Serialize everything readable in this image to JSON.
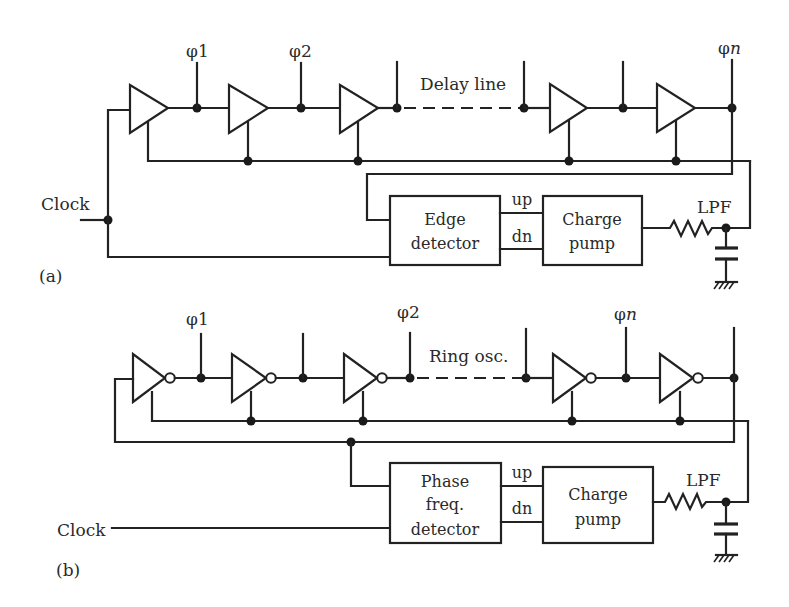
{
  "figure": {
    "panels": [
      {
        "id": "a",
        "panel_label": "(a)",
        "title": "Delay line",
        "clock_label": "Clock",
        "phase_labels": [
          "φ1",
          "φ2",
          "φn"
        ],
        "phase_symbol": "φ",
        "phase_n_suffix": "n",
        "stage_type": "buffer",
        "detector": {
          "lines": [
            "Edge",
            "detector"
          ]
        },
        "charge_pump": {
          "lines": [
            "Charge",
            "pump"
          ]
        },
        "signals": {
          "up": "up",
          "dn": "dn"
        },
        "filter_label": "LPF"
      },
      {
        "id": "b",
        "panel_label": "(b)",
        "title": "Ring osc.",
        "clock_label": "Clock",
        "phase_labels": [
          "φ1",
          "φ2",
          "φn"
        ],
        "phase_symbol": "φ",
        "phase_n_suffix": "n",
        "stage_type": "inverter",
        "detector": {
          "lines": [
            "Phase",
            "freq.",
            "detector"
          ]
        },
        "charge_pump": {
          "lines": [
            "Charge",
            "pump"
          ]
        },
        "signals": {
          "up": "up",
          "dn": "dn"
        },
        "filter_label": "LPF"
      }
    ]
  }
}
